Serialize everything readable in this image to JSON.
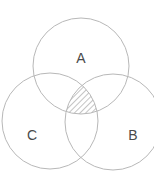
{
  "diagram": {
    "type": "venn",
    "sets": [
      {
        "id": "A",
        "label": "A",
        "cx": 81,
        "cy": 66,
        "r": 48,
        "label_x": 81,
        "label_y": 59
      },
      {
        "id": "B",
        "label": "B",
        "cx": 113,
        "cy": 122,
        "r": 48,
        "label_x": 133,
        "label_y": 136
      },
      {
        "id": "C",
        "label": "C",
        "cx": 50,
        "cy": 121,
        "r": 48,
        "label_x": 32,
        "label_y": 136
      }
    ],
    "highlighted_region": {
      "description": "A ∩ B ∩ C",
      "fill": "diagonal-hatch"
    },
    "colors": {
      "circle_stroke": "#b8b8b8",
      "hatch": "#8a8a8a",
      "label": "#4a4a4a",
      "background": "#ffffff"
    }
  }
}
